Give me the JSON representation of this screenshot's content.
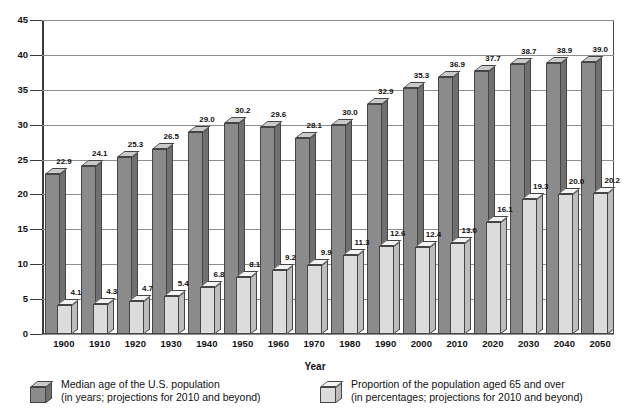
{
  "chart_data": {
    "type": "bar",
    "title": "",
    "xlabel": "Year",
    "ylabel": "",
    "ylim": [
      0,
      45
    ],
    "yticks": [
      0,
      5,
      10,
      15,
      20,
      25,
      30,
      35,
      40,
      45
    ],
    "grid": true,
    "legend_position": "bottom",
    "categories": [
      "1900",
      "1910",
      "1920",
      "1930",
      "1940",
      "1950",
      "1960",
      "1970",
      "1980",
      "1990",
      "2000",
      "2010",
      "2020",
      "2030",
      "2040",
      "2050"
    ],
    "series": [
      {
        "name": "Median age of the U.S. population",
        "values": [
          22.9,
          24.1,
          25.3,
          26.5,
          29.0,
          30.2,
          29.6,
          28.1,
          30.0,
          32.9,
          35.3,
          36.9,
          37.7,
          38.7,
          38.9,
          39.0
        ],
        "color": "#8b8b8b"
      },
      {
        "name": "Proportion of the population aged 65 and over",
        "values": [
          4.1,
          4.3,
          4.7,
          5.4,
          6.8,
          8.1,
          9.2,
          9.9,
          11.3,
          12.6,
          12.4,
          13.0,
          16.1,
          19.3,
          20.0,
          20.2
        ],
        "color": "#dcdcdc"
      }
    ]
  },
  "axis": {
    "x_title": "Year",
    "y_tick_labels": [
      "45",
      "40",
      "35",
      "30",
      "25",
      "20",
      "15",
      "10",
      "5",
      "0"
    ]
  },
  "legend": {
    "items": [
      {
        "swatch": "dark-3d-cube-icon",
        "line1": "Median age of the U.S. population",
        "line2": "(in years; projections for 2010 and beyond)"
      },
      {
        "swatch": "light-3d-cube-icon",
        "line1": "Proportion of the population aged 65 and over",
        "line2": "(in percentages; projections for 2010 and beyond)"
      }
    ]
  }
}
